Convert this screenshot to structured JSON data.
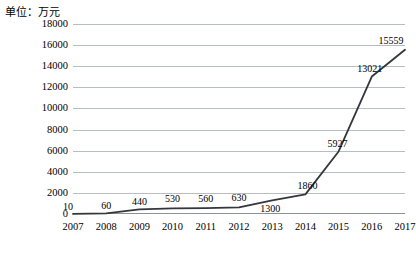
{
  "chart_data": {
    "type": "line",
    "title": "单位：万元",
    "xlabel": "",
    "ylabel": "",
    "categories": [
      "2007",
      "2008",
      "2009",
      "2010",
      "2011",
      "2012",
      "2013",
      "2014",
      "2015",
      "2016",
      "2017"
    ],
    "values": [
      10,
      60,
      440,
      530,
      560,
      630,
      1300,
      1860,
      5927,
      13021,
      15559
    ],
    "point_labels": [
      "10",
      "60",
      "440",
      "530",
      "560",
      "630",
      "1300",
      "1860",
      "5927",
      "13021",
      "15559"
    ],
    "ylim": [
      0,
      18000
    ],
    "ytick_values": [
      0,
      2000,
      4000,
      6000,
      8000,
      10000,
      12000,
      14000,
      16000,
      18000
    ],
    "ytick_labels": [
      "0",
      "2000",
      "4000",
      "6000",
      "8000",
      "10000",
      "12000",
      "14000",
      "16000",
      "18000"
    ],
    "grid": true,
    "legend": false,
    "series_color": "#33363d",
    "grid_color": "#b8bcc4",
    "background": "#ffffff"
  }
}
